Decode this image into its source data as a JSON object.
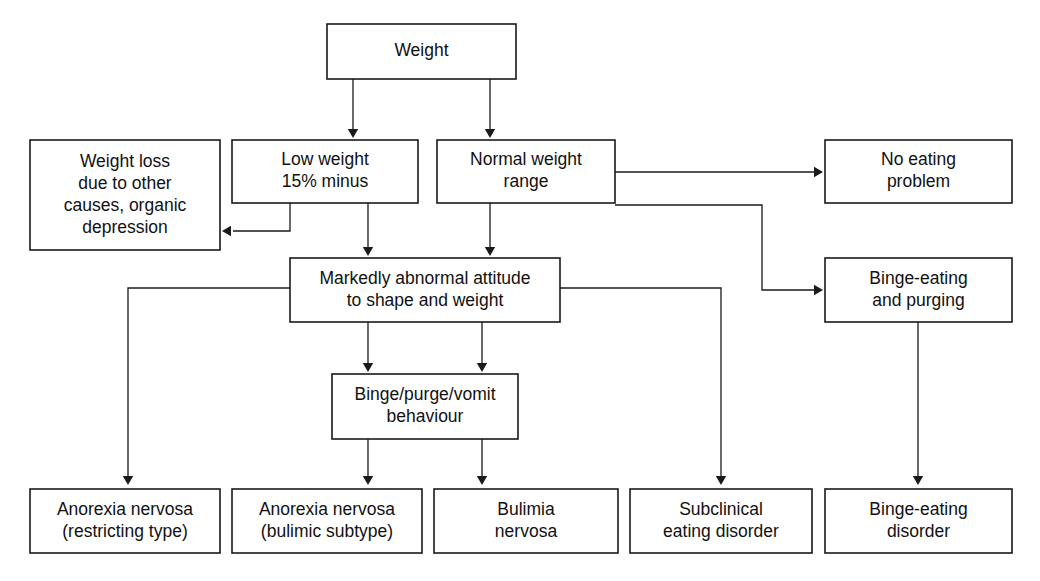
{
  "diagram": {
    "background_color": "#ffffff",
    "line_color": "#1a1a1a",
    "text_color": "#111111",
    "nodes": [
      {
        "id": "weight",
        "lines": [
          "Weight"
        ],
        "x": 327,
        "y": 24,
        "w": 189,
        "h": 55
      },
      {
        "id": "weight-loss-other",
        "lines": [
          "Weight loss",
          "due to other",
          "causes, organic",
          "depression"
        ],
        "x": 30,
        "y": 140,
        "w": 190,
        "h": 110
      },
      {
        "id": "low-weight",
        "lines": [
          "Low weight",
          "15% minus"
        ],
        "x": 232,
        "y": 140,
        "w": 186,
        "h": 63
      },
      {
        "id": "normal-weight",
        "lines": [
          "Normal weight",
          "range"
        ],
        "x": 437,
        "y": 140,
        "w": 178,
        "h": 63
      },
      {
        "id": "no-eating-problem",
        "lines": [
          "No eating",
          "problem"
        ],
        "x": 825,
        "y": 140,
        "w": 187,
        "h": 63
      },
      {
        "id": "markedly-abnormal-attitude",
        "lines": [
          "Markedly abnormal attitude",
          "to shape and weight"
        ],
        "x": 290,
        "y": 258,
        "w": 270,
        "h": 64
      },
      {
        "id": "binge-eating-purging",
        "lines": [
          "Binge-eating",
          "and purging"
        ],
        "x": 825,
        "y": 258,
        "w": 187,
        "h": 64
      },
      {
        "id": "binge-purge-vomit",
        "lines": [
          "Binge/purge/vomit",
          "behaviour"
        ],
        "x": 332,
        "y": 374,
        "w": 186,
        "h": 65
      },
      {
        "id": "anorexia-restricting",
        "lines": [
          "Anorexia nervosa",
          "(restricting type)"
        ],
        "x": 30,
        "y": 489,
        "w": 190,
        "h": 64
      },
      {
        "id": "anorexia-bulimic",
        "lines": [
          "Anorexia nervosa",
          "(bulimic subtype)"
        ],
        "x": 232,
        "y": 489,
        "w": 190,
        "h": 64
      },
      {
        "id": "bulimia-nervosa",
        "lines": [
          "Bulimia",
          "nervosa"
        ],
        "x": 434,
        "y": 489,
        "w": 184,
        "h": 64
      },
      {
        "id": "subclinical-eating-disorder",
        "lines": [
          "Subclinical",
          "eating disorder"
        ],
        "x": 630,
        "y": 489,
        "w": 182,
        "h": 64
      },
      {
        "id": "binge-eating-disorder",
        "lines": [
          "Binge-eating",
          "disorder"
        ],
        "x": 825,
        "y": 489,
        "w": 187,
        "h": 64
      }
    ],
    "edges": [
      {
        "id": "weight-to-low-weight",
        "from": "weight",
        "to": "low-weight",
        "points": "353,79 353,134",
        "arrow": "down",
        "ax": 353,
        "ay": 138
      },
      {
        "id": "weight-to-normal-weight",
        "from": "weight",
        "to": "normal-weight",
        "points": "490,79 490,134",
        "arrow": "down",
        "ax": 490,
        "ay": 138
      },
      {
        "id": "low-weight-to-weight-loss-other",
        "from": "low-weight",
        "to": "weight-loss-other",
        "points": "290,203 290,231 233,231",
        "arrow": "left",
        "ax": 222,
        "ay": 231
      },
      {
        "id": "low-weight-to-attitude",
        "from": "low-weight",
        "to": "markedly-abnormal-attitude",
        "points": "368,203 368,252",
        "arrow": "down",
        "ax": 368,
        "ay": 256
      },
      {
        "id": "normal-weight-to-attitude",
        "from": "normal-weight",
        "to": "markedly-abnormal-attitude",
        "points": "490,203 490,252",
        "arrow": "down",
        "ax": 490,
        "ay": 256
      },
      {
        "id": "normal-weight-to-no-eating-problem",
        "from": "normal-weight",
        "to": "no-eating-problem",
        "points": "615,172 814,172",
        "arrow": "right",
        "ax": 823,
        "ay": 172
      },
      {
        "id": "normal-weight-to-binge-eating-purging",
        "from": "normal-weight",
        "to": "binge-eating-purging",
        "points": "615,205 762,205 762,290 814,290",
        "arrow": "right",
        "ax": 823,
        "ay": 290
      },
      {
        "id": "attitude-to-anorexia-restricting",
        "from": "markedly-abnormal-attitude",
        "to": "anorexia-restricting",
        "points": "290,288 128,288 128,479",
        "arrow": "down",
        "ax": 128,
        "ay": 485
      },
      {
        "id": "attitude-to-subclinical",
        "from": "markedly-abnormal-attitude",
        "to": "subclinical-eating-disorder",
        "points": "560,288 721,288 721,479",
        "arrow": "down",
        "ax": 721,
        "ay": 485
      },
      {
        "id": "attitude-to-binge-purge-vomit-left",
        "from": "markedly-abnormal-attitude",
        "to": "binge-purge-vomit",
        "points": "368,322 368,368",
        "arrow": "down",
        "ax": 368,
        "ay": 372
      },
      {
        "id": "attitude-to-binge-purge-vomit-right",
        "from": "markedly-abnormal-attitude",
        "to": "binge-purge-vomit",
        "points": "482,322 482,368",
        "arrow": "down",
        "ax": 482,
        "ay": 372
      },
      {
        "id": "binge-purge-vomit-to-anorexia-bulimic",
        "from": "binge-purge-vomit",
        "to": "anorexia-bulimic",
        "points": "368,439 368,479",
        "arrow": "down",
        "ax": 368,
        "ay": 485
      },
      {
        "id": "binge-purge-vomit-to-bulimia",
        "from": "binge-purge-vomit",
        "to": "bulimia-nervosa",
        "points": "482,439 482,479",
        "arrow": "down",
        "ax": 482,
        "ay": 485
      },
      {
        "id": "binge-eating-purging-to-binge-eating-disorder",
        "from": "binge-eating-purging",
        "to": "binge-eating-disorder",
        "points": "918,322 918,479",
        "arrow": "down",
        "ax": 918,
        "ay": 485
      }
    ]
  }
}
